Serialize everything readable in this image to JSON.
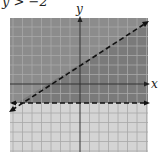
{
  "title": "y > −2",
  "axes": {
    "x_label": "x",
    "y_label": "y"
  },
  "graph": {
    "grid_min": -7,
    "grid_max": 7,
    "boundary_lines": [
      {
        "name": "horizontal",
        "equation": "y = -2",
        "style": "dashed"
      },
      {
        "name": "diagonal",
        "equation": "y = (2/3)x + 2",
        "style": "dashed"
      }
    ],
    "shaded_region": "between y = -2 and y = (2/3)x + 2",
    "colors": {
      "shade_dark": "#8c8c8c",
      "shade_light": "#d4d4d4",
      "grid": "#a8a8a8",
      "line": "#111111"
    }
  }
}
